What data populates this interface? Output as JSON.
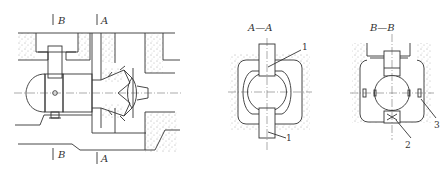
{
  "figure": {
    "type": "technical-drawing",
    "main_view": {
      "section_marks": [
        {
          "id": "B-top",
          "label": "B"
        },
        {
          "id": "A-top",
          "label": "A"
        },
        {
          "id": "B-bottom",
          "label": "B"
        },
        {
          "id": "A-bottom",
          "label": "A"
        }
      ]
    },
    "section_aa": {
      "title": "A—A",
      "callouts": [
        {
          "id": "1a",
          "label": "1"
        },
        {
          "id": "1b",
          "label": "1"
        }
      ]
    },
    "section_bb": {
      "title": "B—B",
      "callouts": [
        {
          "id": "2",
          "label": "2"
        },
        {
          "id": "3",
          "label": "3"
        }
      ]
    }
  }
}
